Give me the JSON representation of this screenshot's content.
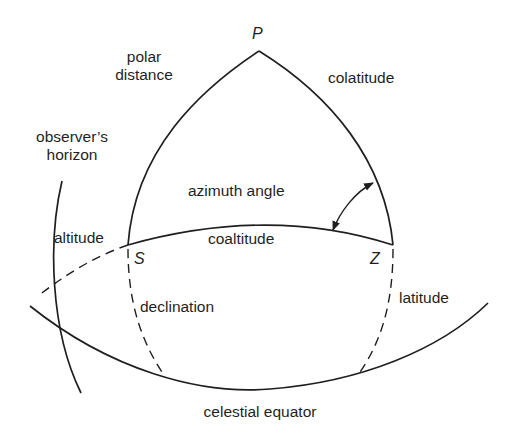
{
  "diagram": {
    "type": "spherical-triangle",
    "points": {
      "pole": "P",
      "star": "S",
      "zenith": "Z"
    },
    "labels": {
      "polar_distance": "polar\ndistance",
      "polar_line1": "polar",
      "polar_line2": "distance",
      "colatitude": "colatitude",
      "observers_line1": "observer’s",
      "observers_line2": "horizon",
      "azimuth_angle": "azimuth angle",
      "altitude": "altitude",
      "coaltitude": "coaltitude",
      "declination": "declination",
      "latitude": "latitude",
      "celestial_equator": "celestial equator"
    },
    "colors": {
      "line": "#1f1f1f",
      "background": "#ffffff"
    }
  }
}
